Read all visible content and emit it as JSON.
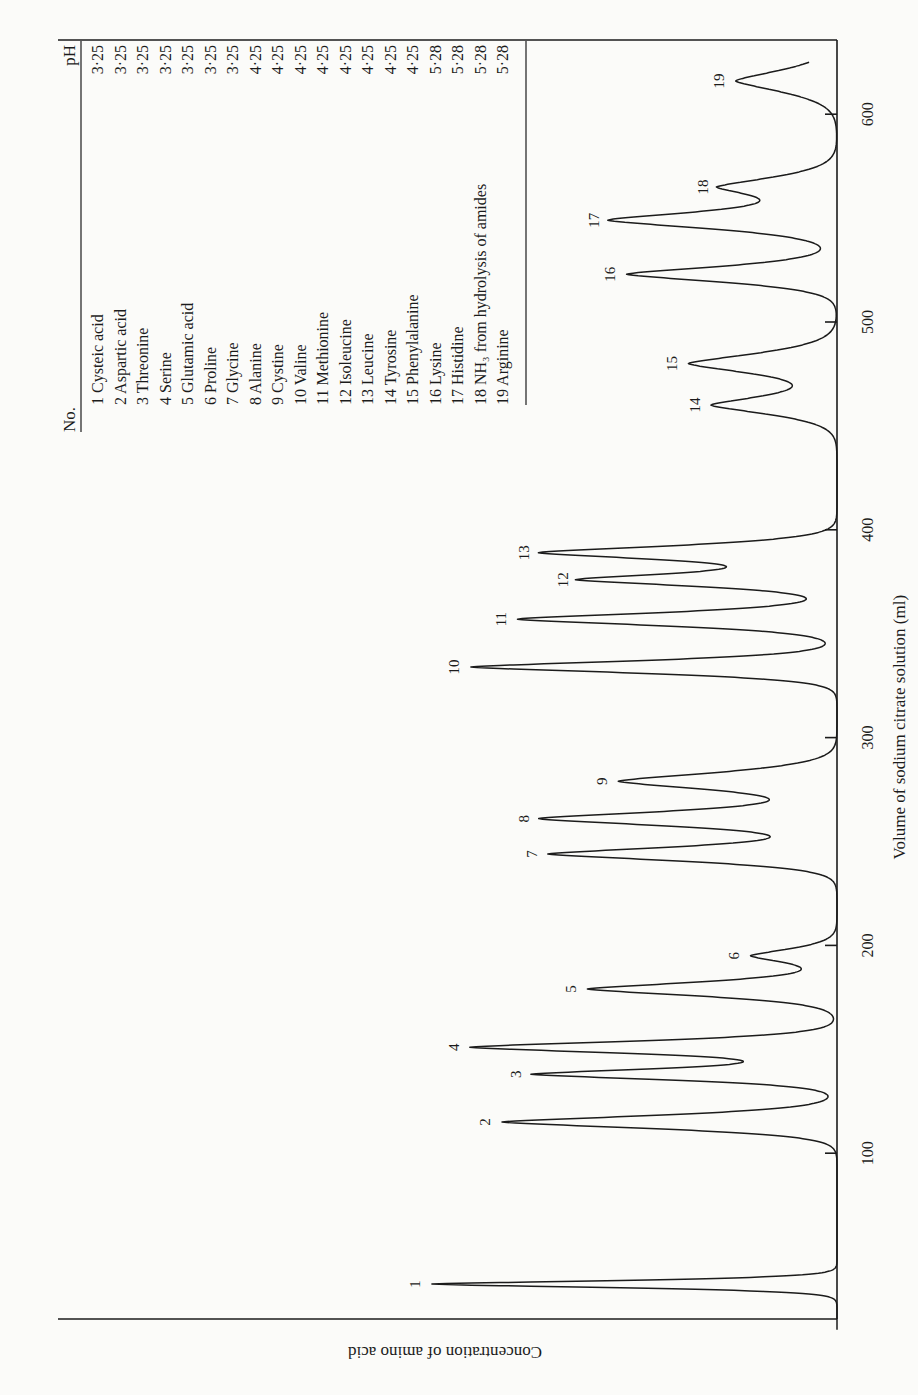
{
  "chart_data": {
    "type": "line",
    "title": "",
    "xlabel": "Volume of sodium citrate solution (ml)",
    "ylabel": "Concentration of amino acid",
    "orientation": "rotated 90° (volume axis vertical, increasing upward; concentration increasing leftward)",
    "x_ticks": [
      100,
      200,
      300,
      400,
      500,
      600
    ],
    "xlim": [
      15,
      625
    ],
    "ylim": [
      0,
      1
    ],
    "grid": false,
    "legend_position": "table at top-left of plot area",
    "series": [
      {
        "name": "Chromatogram",
        "peaks": [
          {
            "no": 1,
            "volume": 37,
            "height": 0.52,
            "width": 1.6
          },
          {
            "no": 2,
            "volume": 115,
            "height": 0.43,
            "width": 3.0
          },
          {
            "no": 3,
            "volume": 138,
            "height": 0.39,
            "width": 2.6
          },
          {
            "no": 4,
            "volume": 151,
            "height": 0.47,
            "width": 2.8
          },
          {
            "no": 5,
            "volume": 179,
            "height": 0.32,
            "width": 3.2
          },
          {
            "no": 6,
            "volume": 195,
            "height": 0.11,
            "width": 3.2
          },
          {
            "no": 7,
            "volume": 244,
            "height": 0.37,
            "width": 3.2
          },
          {
            "no": 8,
            "volume": 261,
            "height": 0.38,
            "width": 3.4
          },
          {
            "no": 9,
            "volume": 279,
            "height": 0.28,
            "width": 4.0
          },
          {
            "no": 10,
            "volume": 334,
            "height": 0.47,
            "width": 2.8
          },
          {
            "no": 11,
            "volume": 357,
            "height": 0.41,
            "width": 3.0
          },
          {
            "no": 12,
            "volume": 376,
            "height": 0.33,
            "width": 3.0
          },
          {
            "no": 13,
            "volume": 389,
            "height": 0.38,
            "width": 3.2
          },
          {
            "no": 14,
            "volume": 460,
            "height": 0.16,
            "width": 4.2
          },
          {
            "no": 15,
            "volume": 480,
            "height": 0.19,
            "width": 4.6
          },
          {
            "no": 16,
            "volume": 523,
            "height": 0.27,
            "width": 3.6
          },
          {
            "no": 17,
            "volume": 549,
            "height": 0.29,
            "width": 4.0
          },
          {
            "no": 18,
            "volume": 565,
            "height": 0.15,
            "width": 4.4
          },
          {
            "no": 19,
            "volume": 616,
            "height": 0.13,
            "width": 5.0
          }
        ]
      }
    ],
    "legend_table": {
      "headers": [
        "No.",
        "pH"
      ],
      "rows": [
        {
          "no": "1",
          "name": "Cysteic acid",
          "ph": "3·25"
        },
        {
          "no": "2",
          "name": "Aspartic acid",
          "ph": "3·25"
        },
        {
          "no": "3",
          "name": "Threonine",
          "ph": "3·25"
        },
        {
          "no": "4",
          "name": "Serine",
          "ph": "3·25"
        },
        {
          "no": "5",
          "name": "Glutamic acid",
          "ph": "3·25"
        },
        {
          "no": "6",
          "name": "Proline",
          "ph": "3·25"
        },
        {
          "no": "7",
          "name": "Glycine",
          "ph": "3·25"
        },
        {
          "no": "8",
          "name": "Alanine",
          "ph": "4·25"
        },
        {
          "no": "9",
          "name": "Cystine",
          "ph": "4·25"
        },
        {
          "no": "10",
          "name": "Valine",
          "ph": "4·25"
        },
        {
          "no": "11",
          "name": "Methionine",
          "ph": "4·25"
        },
        {
          "no": "12",
          "name": "Isoleucine",
          "ph": "4·25"
        },
        {
          "no": "13",
          "name": "Leucine",
          "ph": "4·25"
        },
        {
          "no": "14",
          "name": "Tyrosine",
          "ph": "4·25"
        },
        {
          "no": "15",
          "name": "Phenylalanine",
          "ph": "4·25"
        },
        {
          "no": "16",
          "name": "Lysine",
          "ph": "5·28"
        },
        {
          "no": "17",
          "name": "Histidine",
          "ph": "5·28"
        },
        {
          "no": "18",
          "name": "NH₃ from hydrolysis of amides",
          "ph": "5·28"
        },
        {
          "no": "19",
          "name": "Arginine",
          "ph": "5·28"
        }
      ]
    }
  },
  "layout": {
    "baseline_x": 837,
    "top_y": 40,
    "bottom_y": 1319,
    "left_x": 58,
    "y_at_zero_ml": 1361,
    "px_per_ml": 2.078,
    "conc_full_px": 779,
    "table": {
      "top_y": 41,
      "header_rule_x": 81,
      "end_rule_x": 526,
      "bottom_y": 405,
      "first_row_x": 97,
      "row_pitch": 22.5
    }
  },
  "colors": {
    "ink": "#1b1b1b",
    "paper": "#fbfbf9"
  }
}
